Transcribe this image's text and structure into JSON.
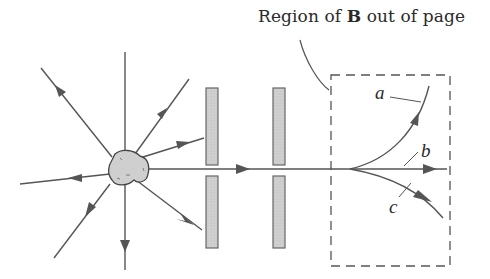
{
  "figure": {
    "title_prefix": "Region of ",
    "title_bold": "B",
    "title_suffix": " out of page",
    "path_labels": {
      "a": "a",
      "b": "b",
      "c": "c"
    }
  },
  "colors": {
    "line": "#555555",
    "plate_fill": "#c8c8c8",
    "plate_edge": "#6a6a6a",
    "source_fill": "#cfcfcf",
    "text": "#2a2a2a"
  },
  "elements": {
    "source": "radioactive-source",
    "collimator_plates": 2,
    "magnetic_region": "dashed-box",
    "paths": [
      "a",
      "b",
      "c"
    ]
  }
}
